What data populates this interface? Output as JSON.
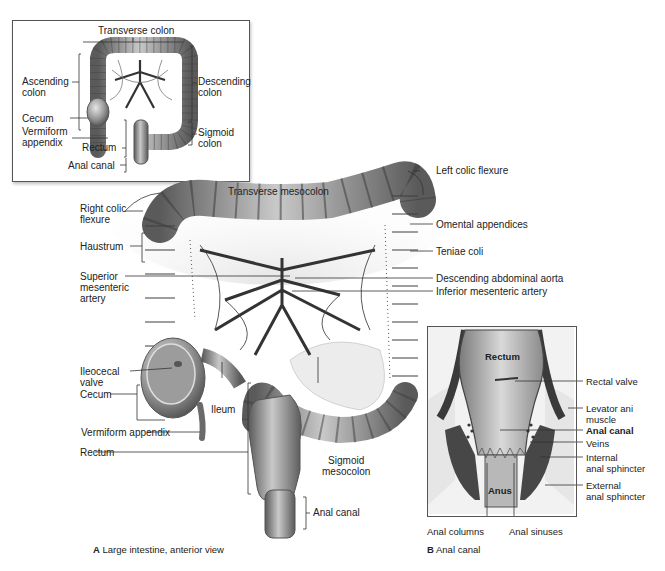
{
  "inset_a": {
    "labels": {
      "transverse_colon": "Transverse colon",
      "ascending_colon": "Ascending\ncolon",
      "descending_colon": "Descending\ncolon",
      "cecum": "Cecum",
      "vermiform_appendix": "Vermiform\nappendix",
      "rectum": "Rectum",
      "sigmoid_colon": "Sigmoid\ncolon",
      "anal_canal": "Anal canal"
    }
  },
  "main": {
    "labels": {
      "transverse_mesocolon": "Transverse mesocolon",
      "left_colic_flexure": "Left colic flexure",
      "right_colic_flexure": "Right colic\nflexure",
      "omental_appendices": "Omental appendices",
      "haustrum": "Haustrum",
      "teniae_coli": "Teniae coli",
      "superior_mesenteric_artery": "Superior\nmesenteric\nartery",
      "descending_abdominal_aorta": "Descending abdominal aorta",
      "inferior_mesenteric_artery": "Inferior mesenteric artery",
      "ileocecal_valve": "Ileocecal\nvalve",
      "cecum": "Cecum",
      "ileum": "Ileum",
      "vermiform_appendix": "Vermiform appendix",
      "rectum": "Rectum",
      "sigmoid_mesocolon": "Sigmoid\nmesocolon",
      "anal_canal": "Anal canal"
    },
    "caption": {
      "letter": "A",
      "text": "Large intestine, anterior view"
    }
  },
  "inset_b": {
    "labels": {
      "rectum": "Rectum",
      "anus": "Anus",
      "rectal_valve": "Rectal valve",
      "levator_ani_muscle": "Levator ani\nmuscle",
      "anal_canal": "Anal canal",
      "veins": "Veins",
      "internal_anal_sphincter": "Internal\nanal sphincter",
      "external_anal_sphincter": "External\nanal sphincter",
      "anal_columns": "Anal columns",
      "anal_sinuses": "Anal sinuses"
    },
    "caption": {
      "letter": "B",
      "text": "Anal canal"
    }
  },
  "colors": {
    "tissue_light": "#c8c8c8",
    "tissue_mid": "#8c8c8c",
    "tissue_dark": "#4a4a4a",
    "leader_line": "#333333",
    "background": "#ffffff"
  }
}
